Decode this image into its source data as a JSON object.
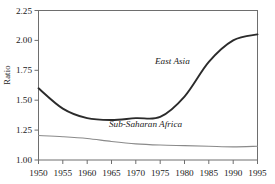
{
  "chart_data": {
    "type": "line",
    "title": "",
    "subtitle": "",
    "xlabel": "",
    "ylabel": "Ratio",
    "xlim": [
      1950,
      1995
    ],
    "ylim": [
      1.0,
      2.25
    ],
    "xticks": [
      1950,
      1955,
      1960,
      1965,
      1970,
      1975,
      1980,
      1985,
      1990,
      1995
    ],
    "xtick_labels": [
      "1950",
      "1955",
      "1960",
      "1965",
      "1970",
      "1975",
      "1980",
      "1985",
      "1990",
      "1995"
    ],
    "yticks": [
      1.0,
      1.25,
      1.5,
      1.75,
      2.0,
      2.25
    ],
    "ytick_labels": [
      "1.00",
      "1.25",
      "1.50",
      "1.75",
      "2.00",
      "2.25"
    ],
    "grid": false,
    "legend_position": "inline-annotations",
    "x": [
      1950,
      1955,
      1960,
      1965,
      1970,
      1975,
      1980,
      1985,
      1990,
      1995
    ],
    "series": [
      {
        "name": "East Asia",
        "color": "#2b2b2b",
        "line_width": 1.9,
        "values": [
          1.6,
          1.43,
          1.35,
          1.335,
          1.35,
          1.36,
          1.53,
          1.82,
          2.0,
          2.05
        ],
        "annotation": {
          "text": "East Asia",
          "x": 1977.5,
          "y": 1.8,
          "style": "italic"
        }
      },
      {
        "name": "Sub-Saharan Africa",
        "color": "#8a8a8a",
        "line_width": 1.1,
        "values": [
          1.205,
          1.195,
          1.18,
          1.155,
          1.135,
          1.125,
          1.12,
          1.115,
          1.11,
          1.115
        ],
        "annotation": {
          "text": "Sub-Saharan Africa",
          "x": 1972.0,
          "y": 1.275,
          "style": "italic"
        }
      }
    ],
    "axis_color": "#6e6e6e",
    "text_color": "#1a1a1a"
  }
}
